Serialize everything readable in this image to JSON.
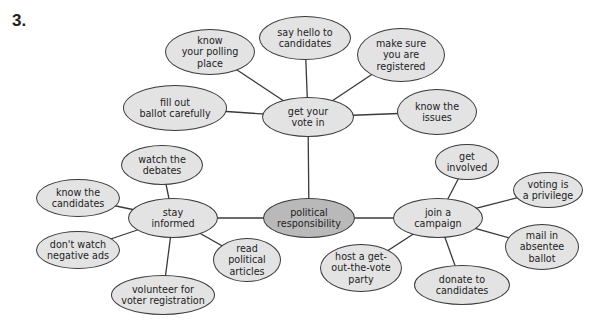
{
  "exercise_number": "3.",
  "colors": {
    "node_fill": "#e3e3e3",
    "center_fill": "#b9b9b9",
    "stroke": "#3a3a3a"
  },
  "nodes": {
    "center": {
      "label": "political\nresponsibility",
      "x": 309,
      "y": 218,
      "w": 92,
      "h": 40
    },
    "vote": {
      "label": "get your\nvote in",
      "x": 308,
      "y": 117,
      "w": 92,
      "h": 40
    },
    "informed": {
      "label": "stay\ninformed",
      "x": 173,
      "y": 218,
      "w": 90,
      "h": 40
    },
    "campaign": {
      "label": "join a\ncampaign",
      "x": 438,
      "y": 218,
      "w": 90,
      "h": 40
    },
    "polling": {
      "label": "know\nyour polling\nplace",
      "x": 210,
      "y": 52,
      "w": 90,
      "h": 46
    },
    "hello": {
      "label": "say hello to\ncandidates",
      "x": 305,
      "y": 38,
      "w": 92,
      "h": 44
    },
    "registered": {
      "label": "make sure\nyou are\nregistered",
      "x": 401,
      "y": 55,
      "w": 88,
      "h": 54
    },
    "ballot": {
      "label": "fill out\nballot carefully",
      "x": 175,
      "y": 108,
      "w": 104,
      "h": 46
    },
    "issues": {
      "label": "know the\nissues",
      "x": 437,
      "y": 112,
      "w": 80,
      "h": 46
    },
    "debates": {
      "label": "watch the\ndebates",
      "x": 162,
      "y": 165,
      "w": 82,
      "h": 40
    },
    "know_candidates": {
      "label": "know the\ncandidates",
      "x": 78,
      "y": 198,
      "w": 84,
      "h": 38
    },
    "negative_ads": {
      "label": "don't watch\nnegative ads",
      "x": 78,
      "y": 250,
      "w": 84,
      "h": 38
    },
    "articles": {
      "label": "read\npolitical\narticles",
      "x": 247,
      "y": 260,
      "w": 68,
      "h": 44
    },
    "volunteer": {
      "label": "volunteer for\nvoter registration",
      "x": 163,
      "y": 295,
      "w": 104,
      "h": 40
    },
    "involved": {
      "label": "get\ninvolved",
      "x": 467,
      "y": 162,
      "w": 64,
      "h": 36
    },
    "privilege": {
      "label": "voting is\na privilege",
      "x": 548,
      "y": 190,
      "w": 70,
      "h": 36
    },
    "absentee": {
      "label": "mail in\nabsentee\nballot",
      "x": 542,
      "y": 247,
      "w": 74,
      "h": 46
    },
    "party": {
      "label": "host a get-\nout-the-vote\nparty",
      "x": 361,
      "y": 268,
      "w": 82,
      "h": 48
    },
    "donate": {
      "label": "donate to\ncandidates",
      "x": 462,
      "y": 285,
      "w": 96,
      "h": 40
    }
  },
  "edges": [
    [
      "center",
      "vote"
    ],
    [
      "center",
      "informed"
    ],
    [
      "center",
      "campaign"
    ],
    [
      "vote",
      "polling"
    ],
    [
      "vote",
      "hello"
    ],
    [
      "vote",
      "registered"
    ],
    [
      "vote",
      "ballot"
    ],
    [
      "vote",
      "issues"
    ],
    [
      "informed",
      "debates"
    ],
    [
      "informed",
      "know_candidates"
    ],
    [
      "informed",
      "negative_ads"
    ],
    [
      "informed",
      "articles"
    ],
    [
      "informed",
      "volunteer"
    ],
    [
      "campaign",
      "involved"
    ],
    [
      "campaign",
      "privilege"
    ],
    [
      "campaign",
      "absentee"
    ],
    [
      "campaign",
      "party"
    ],
    [
      "campaign",
      "donate"
    ]
  ]
}
